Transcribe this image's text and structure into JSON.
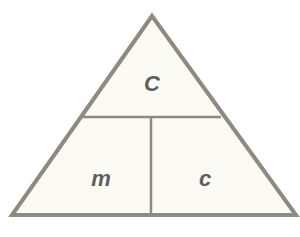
{
  "diagram": {
    "type": "formula-triangle",
    "sections": {
      "top": {
        "label": "C"
      },
      "bottom_left": {
        "label": "m"
      },
      "bottom_right": {
        "label": "c"
      }
    },
    "colors": {
      "fill": "#fbfaf5",
      "stroke": "#8f8a80",
      "text": "#5f5f5f",
      "background": "#ffffff"
    }
  }
}
